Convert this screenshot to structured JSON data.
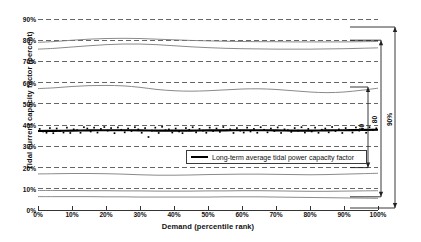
{
  "chart_data": {
    "type": "line",
    "title": "",
    "xlabel": "Demand (percentile rank)",
    "ylabel": "Tidal current capacity factor (percent)",
    "xlim": [
      0,
      100
    ],
    "ylim": [
      0,
      90
    ],
    "grid": true,
    "xticks": [
      "0%",
      "10%",
      "20%",
      "30%",
      "40%",
      "50%",
      "60%",
      "70%",
      "80%",
      "90%",
      "100%"
    ],
    "yticks": [
      "0%",
      "10%",
      "20%",
      "30%",
      "40%",
      "50%",
      "60%",
      "70%",
      "80%",
      "90%"
    ],
    "xtick_values": [
      0,
      10,
      20,
      30,
      40,
      50,
      60,
      70,
      80,
      90,
      100
    ],
    "ytick_values": [
      0,
      10,
      20,
      30,
      40,
      50,
      60,
      70,
      80,
      90
    ],
    "legend": {
      "position": "inside-lower-right",
      "entries": [
        {
          "label": "Long-term average tidal power capacity factor",
          "style": "thick-black-line"
        }
      ]
    },
    "x": [
      0,
      5,
      10,
      15,
      20,
      25,
      30,
      35,
      40,
      45,
      50,
      55,
      60,
      65,
      70,
      75,
      80,
      85,
      90,
      95,
      100
    ],
    "series": [
      {
        "name": "percentile-upper-1",
        "style": "thin-gray-line",
        "values": [
          79.0,
          79.4,
          80.0,
          80.5,
          80.8,
          80.9,
          80.8,
          80.5,
          80.2,
          79.9,
          79.7,
          79.5,
          79.4,
          79.3,
          79.3,
          79.2,
          79.2,
          79.2,
          79.2,
          79.3,
          79.4
        ]
      },
      {
        "name": "percentile-upper-2",
        "style": "thin-gray-line",
        "values": [
          75.8,
          76.2,
          76.8,
          77.4,
          77.9,
          78.2,
          78.2,
          77.9,
          77.4,
          76.9,
          76.5,
          76.2,
          76.0,
          75.9,
          75.8,
          75.8,
          75.8,
          75.9,
          76.0,
          76.2,
          76.4
        ]
      },
      {
        "name": "percentile-mid",
        "style": "thin-gray-line",
        "values": [
          57.2,
          57.6,
          58.2,
          58.6,
          58.7,
          58.5,
          57.8,
          56.8,
          56.2,
          56.0,
          56.2,
          56.6,
          57.0,
          57.1,
          56.8,
          56.2,
          55.6,
          55.3,
          55.6,
          56.4,
          57.4
        ]
      },
      {
        "name": "long-term-average",
        "style": "thick-black-line",
        "values": [
          37.2,
          37.3,
          37.4,
          37.5,
          37.6,
          37.6,
          37.5,
          37.4,
          37.4,
          37.4,
          37.5,
          37.5,
          37.6,
          37.6,
          37.5,
          37.4,
          37.4,
          37.5,
          37.6,
          37.7,
          37.8
        ]
      },
      {
        "name": "percentile-lower-1",
        "style": "thin-gray-line",
        "values": [
          17.0,
          17.1,
          17.2,
          17.2,
          17.1,
          16.9,
          16.6,
          16.4,
          16.4,
          16.5,
          16.7,
          16.8,
          16.9,
          16.9,
          16.8,
          16.7,
          16.6,
          16.7,
          16.9,
          17.1,
          17.3
        ]
      },
      {
        "name": "percentile-lower-2",
        "style": "thin-gray-line",
        "values": [
          9.2,
          9.2,
          9.2,
          9.1,
          9.1,
          9.0,
          9.0,
          8.9,
          8.9,
          8.9,
          9.0,
          9.0,
          9.1,
          9.1,
          9.0,
          8.9,
          8.8,
          8.8,
          8.9,
          9.0,
          9.1
        ]
      },
      {
        "name": "percentile-lower-3",
        "style": "thin-gray-line",
        "values": [
          6.3,
          6.3,
          6.3,
          6.3,
          6.2,
          6.2,
          6.1,
          6.1,
          6.1,
          6.1,
          6.1,
          6.2,
          6.2,
          6.2,
          6.1,
          6.0,
          5.9,
          5.8,
          5.7,
          5.6,
          5.5
        ]
      }
    ],
    "scatter": {
      "name": "annual tidal capacity factor samples",
      "marker": "small filled square",
      "x": [
        0.5,
        1.5,
        2.5,
        3.5,
        4.5,
        5.5,
        6.5,
        7.5,
        8.5,
        9.5,
        10.5,
        11.5,
        12.5,
        13.5,
        14.5,
        15.5,
        16.5,
        17.5,
        18.5,
        19.5,
        20.5,
        21.5,
        22.5,
        23.5,
        24.5,
        25.5,
        26.5,
        27.5,
        28.5,
        29.5,
        30.5,
        31.5,
        32.5,
        33.5,
        34.5,
        35.5,
        36.5,
        37.5,
        38.5,
        39.5,
        40.5,
        41.5,
        42.5,
        43.5,
        44.5,
        45.5,
        46.5,
        47.5,
        48.5,
        49.5,
        50.5,
        51.5,
        52.5,
        53.5,
        54.5,
        55.5,
        56.5,
        57.5,
        58.5,
        59.5,
        60.5,
        61.5,
        62.5,
        63.5,
        64.5,
        65.5,
        66.5,
        67.5,
        68.5,
        69.5,
        70.5,
        71.5,
        72.5,
        73.5,
        74.5,
        75.5,
        76.5,
        77.5,
        78.5,
        79.5,
        80.5,
        81.5,
        82.5,
        83.5,
        84.5,
        85.5,
        86.5,
        87.5,
        88.5,
        89.5,
        90.5,
        91.5,
        92.5,
        93.5,
        94.5,
        95.5,
        96.5,
        97.5,
        98.5,
        99.5
      ],
      "y": [
        38.2,
        37.0,
        36.4,
        38.6,
        36.2,
        38.4,
        37.2,
        36.5,
        38.8,
        36.3,
        38.0,
        37.6,
        36.4,
        39.0,
        38.4,
        37.0,
        38.8,
        36.5,
        38.2,
        39.1,
        37.4,
        38.6,
        36.2,
        38.9,
        37.8,
        36.6,
        38.4,
        37.2,
        39.0,
        38.0,
        36.4,
        38.6,
        34.4,
        37.4,
        38.8,
        36.3,
        39.2,
        37.6,
        38.0,
        36.5,
        38.4,
        37.0,
        36.2,
        38.6,
        37.8,
        39.0,
        36.6,
        38.2,
        37.4,
        36.4,
        38.8,
        37.2,
        38.4,
        36.8,
        39.1,
        37.6,
        38.0,
        36.3,
        38.6,
        37.4,
        36.5,
        38.8,
        37.0,
        38.2,
        36.4,
        39.0,
        37.8,
        36.6,
        38.4,
        37.2,
        38.9,
        36.3,
        38.0,
        37.6,
        36.8,
        38.6,
        37.4,
        39.0,
        36.5,
        38.2,
        37.0,
        38.8,
        36.4,
        37.8,
        38.4,
        36.6,
        39.1,
        37.2,
        38.0,
        36.3,
        38.6,
        37.6,
        36.5,
        38.9,
        37.4,
        38.2,
        36.4,
        39.0,
        37.8,
        38.5
      ]
    },
    "annotations": [
      {
        "name": "inner-range-bracket",
        "label": "50",
        "orientation": "vertical",
        "from_y": 17.0,
        "to_y": 58.0
      },
      {
        "name": "middle-range-bracket",
        "label": "80",
        "orientation": "vertical",
        "from_y": 6.2,
        "to_y": 80.0
      },
      {
        "name": "outer-range-bracket",
        "label": "90%",
        "orientation": "vertical",
        "from_y": 0.5,
        "to_y": 86.0
      }
    ]
  }
}
